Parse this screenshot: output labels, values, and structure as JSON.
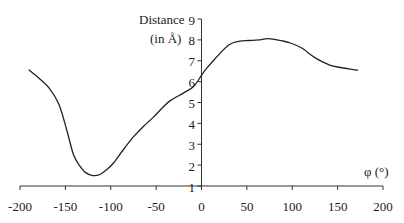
{
  "chart_data": {
    "type": "line",
    "title": "",
    "xlabel": "φ (°)",
    "ylabel": "Distance (in Å)",
    "ylabel_lines": [
      "Distance",
      "(in Å)"
    ],
    "xlim": [
      -200,
      200
    ],
    "ylim": [
      1,
      9
    ],
    "x_ticks": [
      -200,
      -150,
      -100,
      -50,
      0,
      50,
      100,
      150,
      200
    ],
    "x_tick_labels": [
      "-200",
      "-150",
      "-100",
      "-50",
      "0",
      "50",
      "100",
      "150",
      "200"
    ],
    "y_ticks": [
      1,
      2,
      3,
      4,
      5,
      6,
      7,
      8,
      9
    ],
    "y_tick_labels": [
      "1",
      "2",
      "3",
      "4",
      "5",
      "6",
      "7",
      "8",
      "9"
    ],
    "grid": false,
    "legend": null,
    "series": [
      {
        "name": "Distance",
        "color": "#222222",
        "x": [
          -190,
          -180,
          -168,
          -157,
          -148,
          -141,
          -134,
          -128,
          -120,
          -112,
          -104,
          -97,
          -86,
          -75,
          -64,
          -53,
          -43,
          -34,
          -20,
          -9,
          0,
          4,
          15,
          30,
          41,
          52,
          63,
          74,
          89,
          98,
          111,
          117,
          125,
          134,
          142,
          150,
          160,
          172
        ],
        "values": [
          6.55,
          6.2,
          5.7,
          4.9,
          3.6,
          2.5,
          1.95,
          1.65,
          1.5,
          1.55,
          1.8,
          2.1,
          2.75,
          3.35,
          3.85,
          4.3,
          4.75,
          5.1,
          5.45,
          5.75,
          6.3,
          6.55,
          7.1,
          7.75,
          7.93,
          7.97,
          8.0,
          8.06,
          7.95,
          7.85,
          7.6,
          7.4,
          7.15,
          6.93,
          6.78,
          6.7,
          6.63,
          6.55
        ]
      }
    ]
  }
}
